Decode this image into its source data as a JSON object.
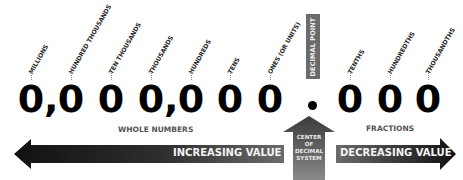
{
  "diagram": {
    "places": [
      {
        "label": "MILLIONS",
        "digit": "0",
        "x": 20
      },
      {
        "label": "HUNDRED THOUSANDS",
        "digit": "0",
        "x": 62
      },
      {
        "label": "TEN THOUSANDS",
        "digit": "0",
        "x": 102
      },
      {
        "label": "THOUSANDS",
        "digit": "0",
        "x": 140
      },
      {
        "label": "HUNDREDS",
        "digit": "0",
        "x": 182
      },
      {
        "label": "TENS",
        "digit": "0",
        "x": 220
      },
      {
        "label": "ONES (OR UNITS)",
        "digit": "0",
        "x": 260
      },
      {
        "label": "TENTHS",
        "digit": "0",
        "x": 341
      },
      {
        "label": "HUNDREDTHS",
        "digit": "0",
        "x": 381
      },
      {
        "label": "THOUSANDTHS",
        "digit": "0",
        "x": 419
      }
    ],
    "separators": [
      {
        "char": ",",
        "x": 49
      },
      {
        "char": ",",
        "x": 169
      }
    ],
    "decimal_point_label": "DECIMAL POINT",
    "decimal_point_char": ".",
    "whole_numbers_label": "WHOLE NUMBERS",
    "fractions_label": "FRACTIONS",
    "increasing_label": "INCREASING VALUE",
    "decreasing_label": "DECREASING VALUE",
    "center_label": "CENTER OF DECIMAL SYSTEM",
    "center_lines": [
      "CENTER",
      "OF",
      "DECIMAL",
      "SYSTEM"
    ]
  },
  "colors": {
    "arrow_dark": "#1a1a1a",
    "arrow_mid": "#6a6a6a",
    "decimal_bar": "#6b6b6b",
    "digit": "#000000"
  }
}
